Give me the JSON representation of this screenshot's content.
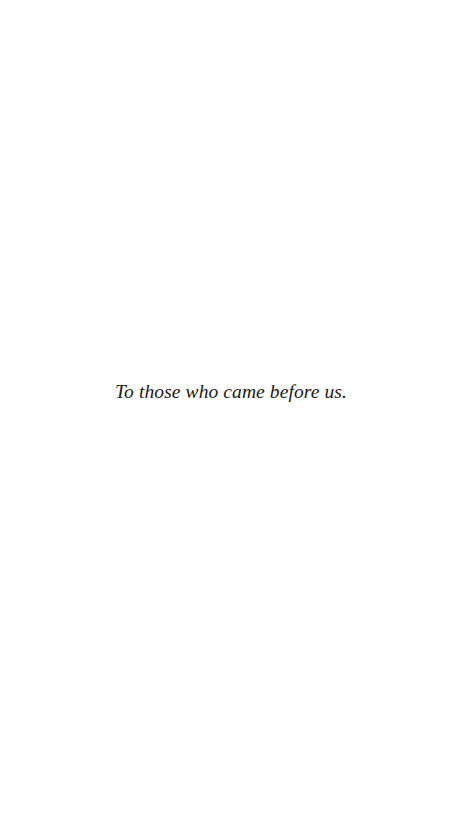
{
  "page": {
    "type": "dedication",
    "dedication_text": "To those who came before us."
  },
  "colors": {
    "background": "#ffffff",
    "text": "#1a1a1a"
  }
}
